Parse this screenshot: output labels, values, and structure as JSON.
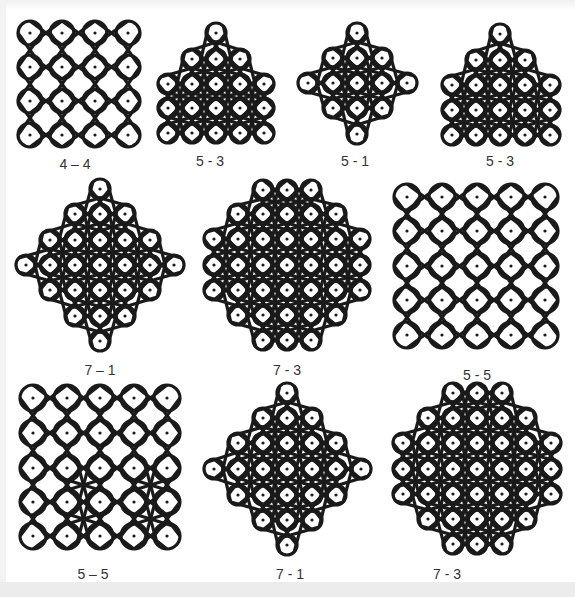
{
  "figure": {
    "stroke_color": "#1a1a1a",
    "background": "#ffffff",
    "panels": [
      {
        "id": "p1",
        "label": "4 – 4",
        "label_pos": [
          75,
          156
        ],
        "dots": [
          [
            30,
            33
          ],
          [
            62,
            33
          ],
          [
            95,
            33
          ],
          [
            128,
            33
          ],
          [
            30,
            67
          ],
          [
            62,
            67
          ],
          [
            95,
            67
          ],
          [
            128,
            67
          ],
          [
            30,
            101
          ],
          [
            62,
            101
          ],
          [
            95,
            101
          ],
          [
            128,
            101
          ],
          [
            30,
            135
          ],
          [
            62,
            135
          ],
          [
            95,
            135
          ],
          [
            128,
            135
          ]
        ],
        "r": 12
      },
      {
        "id": "p2",
        "label": "5 - 3",
        "label_pos": [
          210,
          153
        ],
        "dots": [
          [
            216,
            33
          ],
          [
            192,
            59
          ],
          [
            216,
            59
          ],
          [
            240,
            59
          ],
          [
            168,
            84
          ],
          [
            192,
            84
          ],
          [
            216,
            84
          ],
          [
            240,
            84
          ],
          [
            264,
            84
          ],
          [
            168,
            108
          ],
          [
            192,
            108
          ],
          [
            216,
            108
          ],
          [
            240,
            108
          ],
          [
            264,
            108
          ],
          [
            168,
            133
          ],
          [
            192,
            133
          ],
          [
            216,
            133
          ],
          [
            240,
            133
          ],
          [
            264,
            133
          ]
        ],
        "r": 10
      },
      {
        "id": "p3",
        "label": "5 - 1",
        "label_pos": [
          355,
          153
        ],
        "dots": [
          [
            357,
            33
          ],
          [
            333,
            58
          ],
          [
            357,
            58
          ],
          [
            382,
            58
          ],
          [
            308,
            83
          ],
          [
            333,
            83
          ],
          [
            357,
            83
          ],
          [
            382,
            83
          ],
          [
            407,
            83
          ],
          [
            333,
            108
          ],
          [
            357,
            108
          ],
          [
            382,
            108
          ],
          [
            357,
            134
          ]
        ],
        "r": 10
      },
      {
        "id": "p4",
        "label": "5 - 3",
        "label_pos": [
          500,
          153
        ],
        "dots": [
          [
            500,
            34
          ],
          [
            476,
            60
          ],
          [
            500,
            60
          ],
          [
            525,
            60
          ],
          [
            452,
            85
          ],
          [
            476,
            85
          ],
          [
            500,
            85
          ],
          [
            525,
            85
          ],
          [
            550,
            85
          ],
          [
            452,
            110
          ],
          [
            476,
            110
          ],
          [
            500,
            110
          ],
          [
            525,
            110
          ],
          [
            550,
            110
          ],
          [
            452,
            135
          ],
          [
            476,
            135
          ],
          [
            500,
            135
          ],
          [
            525,
            135
          ],
          [
            550,
            135
          ]
        ],
        "r": 10
      },
      {
        "id": "p5",
        "label": "7 – 1",
        "label_pos": [
          100,
          362
        ],
        "dots": [
          [
            100,
            189
          ],
          [
            75,
            214
          ],
          [
            100,
            214
          ],
          [
            125,
            214
          ],
          [
            50,
            240
          ],
          [
            75,
            240
          ],
          [
            100,
            240
          ],
          [
            125,
            240
          ],
          [
            150,
            240
          ],
          [
            26,
            265
          ],
          [
            50,
            265
          ],
          [
            75,
            265
          ],
          [
            100,
            265
          ],
          [
            125,
            265
          ],
          [
            150,
            265
          ],
          [
            174,
            265
          ],
          [
            50,
            290
          ],
          [
            75,
            290
          ],
          [
            100,
            290
          ],
          [
            125,
            290
          ],
          [
            150,
            290
          ],
          [
            75,
            316
          ],
          [
            100,
            316
          ],
          [
            125,
            316
          ],
          [
            100,
            341
          ]
        ],
        "r": 10
      },
      {
        "id": "p6",
        "label": "7 - 3",
        "label_pos": [
          287,
          362
        ],
        "dots": [
          [
            263,
            190
          ],
          [
            287,
            190
          ],
          [
            311,
            190
          ],
          [
            238,
            214
          ],
          [
            263,
            214
          ],
          [
            287,
            214
          ],
          [
            311,
            214
          ],
          [
            336,
            214
          ],
          [
            214,
            239
          ],
          [
            238,
            239
          ],
          [
            263,
            239
          ],
          [
            287,
            239
          ],
          [
            311,
            239
          ],
          [
            336,
            239
          ],
          [
            360,
            239
          ],
          [
            214,
            265
          ],
          [
            238,
            265
          ],
          [
            263,
            265
          ],
          [
            287,
            265
          ],
          [
            311,
            265
          ],
          [
            336,
            265
          ],
          [
            360,
            265
          ],
          [
            214,
            290
          ],
          [
            238,
            290
          ],
          [
            263,
            290
          ],
          [
            287,
            290
          ],
          [
            311,
            290
          ],
          [
            336,
            290
          ],
          [
            360,
            290
          ],
          [
            238,
            315
          ],
          [
            263,
            315
          ],
          [
            287,
            315
          ],
          [
            311,
            315
          ],
          [
            336,
            315
          ],
          [
            263,
            340
          ],
          [
            287,
            340
          ],
          [
            311,
            340
          ]
        ],
        "r": 10
      },
      {
        "id": "p7",
        "label": "5 - 5",
        "label_pos": [
          477,
          367
        ],
        "dots": [
          [
            407,
            197
          ],
          [
            442,
            197
          ],
          [
            477,
            197
          ],
          [
            511,
            197
          ],
          [
            545,
            197
          ],
          [
            407,
            231
          ],
          [
            442,
            231
          ],
          [
            477,
            231
          ],
          [
            511,
            231
          ],
          [
            545,
            231
          ],
          [
            407,
            266
          ],
          [
            442,
            266
          ],
          [
            477,
            266
          ],
          [
            511,
            266
          ],
          [
            545,
            266
          ],
          [
            407,
            300
          ],
          [
            442,
            300
          ],
          [
            477,
            300
          ],
          [
            511,
            300
          ],
          [
            545,
            300
          ],
          [
            407,
            335
          ],
          [
            442,
            335
          ],
          [
            477,
            335
          ],
          [
            511,
            335
          ],
          [
            545,
            335
          ]
        ],
        "r": 13
      },
      {
        "id": "p8",
        "label": "5 – 5",
        "label_pos": [
          93,
          566
        ],
        "dots": [
          [
            33,
            398
          ],
          [
            67,
            398
          ],
          [
            100,
            398
          ],
          [
            134,
            398
          ],
          [
            167,
            398
          ],
          [
            33,
            433
          ],
          [
            67,
            433
          ],
          [
            100,
            433
          ],
          [
            134,
            433
          ],
          [
            167,
            433
          ],
          [
            33,
            468
          ],
          [
            67,
            468
          ],
          [
            100,
            468
          ],
          [
            134,
            468
          ],
          [
            167,
            468
          ],
          [
            33,
            502
          ],
          [
            67,
            502
          ],
          [
            100,
            502
          ],
          [
            134,
            502
          ],
          [
            167,
            502
          ],
          [
            33,
            536
          ],
          [
            67,
            536
          ],
          [
            100,
            536
          ],
          [
            134,
            536
          ],
          [
            167,
            536
          ]
        ],
        "r": 13
      },
      {
        "id": "p9",
        "label": "7 - 1",
        "label_pos": [
          290,
          566
        ],
        "dots": [
          [
            287,
            393
          ],
          [
            263,
            418
          ],
          [
            287,
            418
          ],
          [
            312,
            418
          ],
          [
            238,
            443
          ],
          [
            263,
            443
          ],
          [
            287,
            443
          ],
          [
            312,
            443
          ],
          [
            336,
            443
          ],
          [
            214,
            469
          ],
          [
            238,
            469
          ],
          [
            263,
            469
          ],
          [
            287,
            469
          ],
          [
            312,
            469
          ],
          [
            336,
            469
          ],
          [
            361,
            469
          ],
          [
            238,
            495
          ],
          [
            263,
            495
          ],
          [
            287,
            495
          ],
          [
            312,
            495
          ],
          [
            336,
            495
          ],
          [
            263,
            520
          ],
          [
            287,
            520
          ],
          [
            312,
            520
          ],
          [
            287,
            545
          ]
        ],
        "r": 10
      },
      {
        "id": "p10",
        "label": "7 - 3",
        "label_pos": [
          447,
          566
        ],
        "dots": [
          [
            453,
            393
          ],
          [
            477,
            393
          ],
          [
            502,
            393
          ],
          [
            428,
            418
          ],
          [
            453,
            418
          ],
          [
            477,
            418
          ],
          [
            502,
            418
          ],
          [
            526,
            418
          ],
          [
            403,
            443
          ],
          [
            428,
            443
          ],
          [
            453,
            443
          ],
          [
            477,
            443
          ],
          [
            502,
            443
          ],
          [
            526,
            443
          ],
          [
            551,
            443
          ],
          [
            403,
            469
          ],
          [
            428,
            469
          ],
          [
            453,
            469
          ],
          [
            477,
            469
          ],
          [
            502,
            469
          ],
          [
            526,
            469
          ],
          [
            551,
            469
          ],
          [
            403,
            494
          ],
          [
            428,
            494
          ],
          [
            453,
            494
          ],
          [
            477,
            494
          ],
          [
            502,
            494
          ],
          [
            526,
            494
          ],
          [
            551,
            494
          ],
          [
            428,
            519
          ],
          [
            453,
            519
          ],
          [
            477,
            519
          ],
          [
            502,
            519
          ],
          [
            526,
            519
          ],
          [
            453,
            544
          ],
          [
            477,
            544
          ],
          [
            502,
            544
          ]
        ],
        "r": 10
      }
    ]
  }
}
